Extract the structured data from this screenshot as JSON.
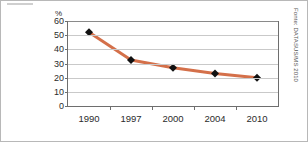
{
  "figure": {
    "background_color": "#ffffff",
    "border_color": "#b8b8b8"
  },
  "source": {
    "text": "Fonte: DATASUS/MS 2010"
  },
  "axes": {
    "y_unit_label": "%",
    "y_ticks": [
      "0",
      "10",
      "20",
      "30",
      "40",
      "50",
      "60"
    ],
    "x_ticks": [
      "1990",
      "1997",
      "2000",
      "2004",
      "2010"
    ]
  },
  "chart_data": {
    "type": "line",
    "title": "",
    "subtitle": "",
    "xlabel": "",
    "ylabel": "%",
    "categories": [
      "1990",
      "1997",
      "2000",
      "2004",
      "2010"
    ],
    "values": [
      52,
      32.5,
      27,
      23,
      20
    ],
    "series": [
      {
        "name": "",
        "values": [
          52,
          32.5,
          27,
          23,
          20
        ],
        "line_color": "#D4704A",
        "marker_color": "#111111",
        "marker_shape": "diamond"
      }
    ],
    "ylim": [
      0,
      60
    ],
    "ytick_step": 10,
    "grid": true,
    "grid_color": "#c9c9c9",
    "legend": "none",
    "annotations": []
  }
}
